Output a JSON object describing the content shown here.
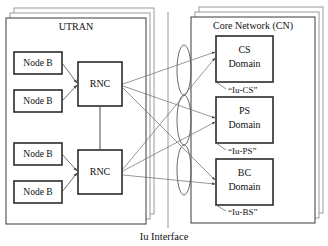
{
  "diagram": {
    "caption": "Iu Interface",
    "containers": [
      {
        "id": "utran",
        "title": "UTRAN"
      },
      {
        "id": "cn",
        "title": "Core Network (CN)"
      }
    ],
    "node_b": [
      {
        "label": "Node B"
      },
      {
        "label": "Node B"
      },
      {
        "label": "Node B"
      },
      {
        "label": "Node B"
      }
    ],
    "rnc": [
      {
        "label": "RNC"
      },
      {
        "label": "RNC"
      }
    ],
    "domains": [
      {
        "name": "CS",
        "suffix": "Domain",
        "interface": "“Iu-CS”"
      },
      {
        "name": "PS",
        "suffix": "Domain",
        "interface": "“Iu-PS”"
      },
      {
        "name": "BC",
        "suffix": "Domain",
        "interface": "“Iu-BS”"
      }
    ],
    "colors": {
      "background": "#ffffff",
      "box_stroke": "#2b2b2b",
      "container_stroke": "#3a3a3a",
      "shadow_stroke": "#9a9a9a",
      "line": "#4a4a4a",
      "text": "#111111"
    }
  }
}
